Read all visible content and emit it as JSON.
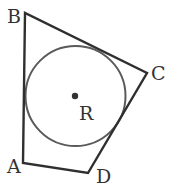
{
  "diagram": {
    "title": "",
    "quadrilateral": {
      "vertices": [
        {
          "name": "A",
          "x": 23,
          "y": 163
        },
        {
          "name": "B",
          "x": 25,
          "y": 13
        },
        {
          "name": "C",
          "x": 147,
          "y": 73
        },
        {
          "name": "D",
          "x": 88,
          "y": 173
        }
      ],
      "stroke": "#2f2f2f"
    },
    "circle": {
      "center_label": "R",
      "cx": 75.5,
      "cy": 96,
      "r": 50,
      "stroke": "#5a5a5a"
    },
    "labels": {
      "A": "A",
      "B": "B",
      "C": "C",
      "D": "D",
      "R": "R"
    }
  }
}
